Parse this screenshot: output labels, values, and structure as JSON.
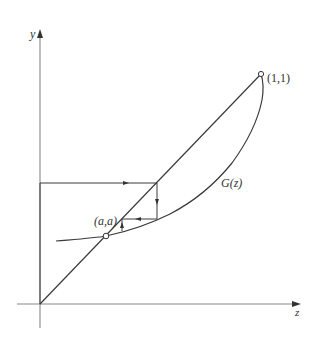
{
  "figure": {
    "type": "cobweb-diagram",
    "axes": {
      "x_label": "z",
      "y_label": "y"
    },
    "labels": {
      "fixed_point_top": "(1,1)",
      "fixed_point_bottom": "(a,a)",
      "curve": "G(z)"
    },
    "elements": [
      {
        "name": "diagonal",
        "description": "line y = z from origin to (1,1)"
      },
      {
        "name": "curve",
        "description": "G(z), convex curve meeting diagonal at (a,a) and (1,1)"
      },
      {
        "name": "cobweb",
        "description": "iteration staircase converging toward (a,a)"
      }
    ],
    "colors": {
      "line": "#3a3a3a",
      "axis": "#888888",
      "text": "#333333"
    }
  }
}
